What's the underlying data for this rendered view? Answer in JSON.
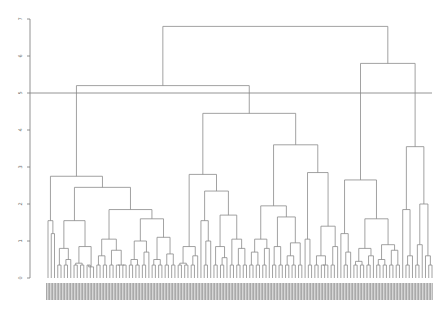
{
  "chart_data": {
    "type": "dendrogram",
    "title": "",
    "xlabel": "",
    "ylabel": "",
    "ylim": [
      0,
      7
    ],
    "y_ticks": [
      0,
      1,
      2,
      3,
      4,
      5,
      6,
      7
    ],
    "grid": false,
    "cut_line_height": 5.0,
    "leaf_labels": "illegible (dense rotated text, ~100 leaves)",
    "layout": {
      "plot_left": 48,
      "plot_right": 432,
      "y0_px": 278,
      "px_per_unit": 37
    },
    "tree": {
      "h": 6.8,
      "children": [
        {
          "h": 5.2,
          "children": [
            {
              "h": 2.75,
              "children": [
                {
                  "h": 1.55,
                  "children": [
                    {
                      "leaves": 1
                    },
                    {
                      "h": 1.2,
                      "children": [
                        {
                          "leaves": 1
                        },
                        {
                          "leaves": 1
                        }
                      ]
                    }
                  ]
                },
                {
                  "h": 2.45,
                  "children": [
                    {
                      "h": 1.55,
                      "children": [
                        {
                          "h": 0.8,
                          "children": [
                            {
                              "leaves": 2
                            },
                            {
                              "h": 0.5,
                              "children": [
                                {
                                  "leaves": 2
                                },
                                {
                                  "leaves": 1
                                }
                              ]
                            }
                          ]
                        },
                        {
                          "h": 0.85,
                          "children": [
                            {
                              "h": 0.4,
                              "children": [
                                {
                                  "leaves": 2
                                },
                                {
                                  "leaves": 2
                                }
                              ]
                            },
                            {
                              "h": 0.3,
                              "children": [
                                {
                                  "leaves": 2
                                },
                                {
                                  "leaves": 1
                                }
                              ]
                            }
                          ]
                        }
                      ]
                    },
                    {
                      "h": 1.85,
                      "children": [
                        {
                          "h": 1.05,
                          "children": [
                            {
                              "h": 0.6,
                              "children": [
                                {
                                  "leaves": 2
                                },
                                {
                                  "leaves": 2
                                }
                              ]
                            },
                            {
                              "h": 0.75,
                              "children": [
                                {
                                  "leaves": 2
                                },
                                {
                                  "h": 0.35,
                                  "children": [
                                    {
                                      "leaves": 2
                                    },
                                    {
                                      "leaves": 2
                                    }
                                  ]
                                }
                              ]
                            }
                          ]
                        },
                        {
                          "h": 1.6,
                          "children": [
                            {
                              "h": 1.0,
                              "children": [
                                {
                                  "h": 0.5,
                                  "children": [
                                    {
                                      "leaves": 2
                                    },
                                    {
                                      "leaves": 2
                                    }
                                  ]
                                },
                                {
                                  "h": 0.7,
                                  "children": [
                                    {
                                      "leaves": 2
                                    },
                                    {
                                      "leaves": 1
                                    }
                                  ]
                                }
                              ]
                            },
                            {
                              "h": 1.1,
                              "children": [
                                {
                                  "h": 0.5,
                                  "children": [
                                    {
                                      "leaves": 2
                                    },
                                    {
                                      "leaves": 2
                                    }
                                  ]
                                },
                                {
                                  "h": 0.65,
                                  "children": [
                                    {
                                      "leaves": 2
                                    },
                                    {
                                      "leaves": 2
                                    }
                                  ]
                                }
                              ]
                            }
                          ]
                        }
                      ]
                    }
                  ]
                }
              ]
            },
            {
              "h": 4.45,
              "children": [
                {
                  "h": 2.8,
                  "children": [
                    {
                      "h": 0.85,
                      "children": [
                        {
                          "h": 0.4,
                          "children": [
                            {
                              "leaves": 2
                            },
                            {
                              "leaves": 2
                            }
                          ]
                        },
                        {
                          "h": 0.6,
                          "children": [
                            {
                              "leaves": 2
                            },
                            {
                              "leaves": 1
                            }
                          ]
                        }
                      ]
                    },
                    {
                      "h": 2.35,
                      "children": [
                        {
                          "h": 1.55,
                          "children": [
                            {
                              "leaves": 1
                            },
                            {
                              "h": 1.0,
                              "children": [
                                {
                                  "leaves": 2
                                },
                                {
                                  "leaves": 1
                                }
                              ]
                            }
                          ]
                        },
                        {
                          "h": 1.7,
                          "children": [
                            {
                              "h": 0.85,
                              "children": [
                                {
                                  "leaves": 2
                                },
                                {
                                  "h": 0.55,
                                  "children": [
                                    {
                                      "leaves": 2
                                    },
                                    {
                                      "leaves": 1
                                    }
                                  ]
                                }
                              ]
                            },
                            {
                              "h": 1.05,
                              "children": [
                                {
                                  "leaves": 2
                                },
                                {
                                  "h": 0.8,
                                  "children": [
                                    {
                                      "leaves": 2
                                    },
                                    {
                                      "leaves": 2
                                    }
                                  ]
                                }
                              ]
                            }
                          ]
                        }
                      ]
                    }
                  ]
                },
                {
                  "h": 3.6,
                  "children": [
                    {
                      "h": 1.95,
                      "children": [
                        {
                          "h": 1.05,
                          "children": [
                            {
                              "h": 0.7,
                              "children": [
                                {
                                  "leaves": 2
                                },
                                {
                                  "leaves": 2
                                }
                              ]
                            },
                            {
                              "h": 0.8,
                              "children": [
                                {
                                  "leaves": 2
                                },
                                {
                                  "leaves": 1
                                }
                              ]
                            }
                          ]
                        },
                        {
                          "h": 1.65,
                          "children": [
                            {
                              "h": 0.85,
                              "children": [
                                {
                                  "leaves": 2
                                },
                                {
                                  "leaves": 2
                                }
                              ]
                            },
                            {
                              "h": 0.95,
                              "children": [
                                {
                                  "h": 0.6,
                                  "children": [
                                    {
                                      "leaves": 2
                                    },
                                    {
                                      "leaves": 2
                                    }
                                  ]
                                },
                                {
                                  "leaves": 2
                                }
                              ]
                            }
                          ]
                        }
                      ]
                    },
                    {
                      "h": 2.85,
                      "children": [
                        {
                          "h": 1.05,
                          "children": [
                            {
                              "leaves": 1
                            },
                            {
                              "leaves": 2
                            }
                          ]
                        },
                        {
                          "h": 1.4,
                          "children": [
                            {
                              "h": 0.6,
                              "children": [
                                {
                                  "leaves": 2
                                },
                                {
                                  "h": 0.35,
                                  "children": [
                                    {
                                      "leaves": 2
                                    },
                                    {
                                      "leaves": 1
                                    }
                                  ]
                                }
                              ]
                            },
                            {
                              "h": 0.85,
                              "children": [
                                {
                                  "leaves": 2
                                },
                                {
                                  "leaves": 1
                                }
                              ]
                            }
                          ]
                        }
                      ]
                    }
                  ]
                }
              ]
            }
          ]
        },
        {
          "h": 5.8,
          "children": [
            {
              "h": 2.65,
              "children": [
                {
                  "h": 1.2,
                  "children": [
                    {
                      "leaves": 1
                    },
                    {
                      "h": 0.7,
                      "children": [
                        {
                          "leaves": 2
                        },
                        {
                          "leaves": 1
                        }
                      ]
                    }
                  ]
                },
                {
                  "h": 1.6,
                  "children": [
                    {
                      "h": 0.8,
                      "children": [
                        {
                          "h": 0.45,
                          "children": [
                            {
                              "leaves": 2
                            },
                            {
                              "leaves": 2
                            }
                          ]
                        },
                        {
                          "h": 0.6,
                          "children": [
                            {
                              "leaves": 2
                            },
                            {
                              "leaves": 1
                            }
                          ]
                        }
                      ]
                    },
                    {
                      "h": 0.9,
                      "children": [
                        {
                          "h": 0.5,
                          "children": [
                            {
                              "leaves": 2
                            },
                            {
                              "leaves": 2
                            }
                          ]
                        },
                        {
                          "h": 0.75,
                          "children": [
                            {
                              "leaves": 2
                            },
                            {
                              "leaves": 2
                            }
                          ]
                        }
                      ]
                    }
                  ]
                }
              ]
            },
            {
              "h": 3.55,
              "children": [
                {
                  "h": 1.85,
                  "children": [
                    {
                      "leaves": 1
                    },
                    {
                      "h": 0.6,
                      "children": [
                        {
                          "leaves": 2
                        },
                        {
                          "leaves": 1
                        }
                      ]
                    }
                  ]
                },
                {
                  "h": 2.0,
                  "children": [
                    {
                      "h": 0.9,
                      "children": [
                        {
                          "leaves": 2
                        },
                        {
                          "leaves": 1
                        }
                      ]
                    },
                    {
                      "h": 0.6,
                      "children": [
                        {
                          "leaves": 1
                        },
                        {
                          "leaves": 2
                        }
                      ]
                    }
                  ]
                }
              ]
            }
          ]
        }
      ]
    }
  }
}
